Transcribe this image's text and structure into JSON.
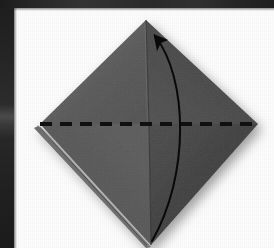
{
  "figure": {
    "kind": "origami-fold-diagram",
    "description": "Gray square sheet rotated 45 degrees (diamond) with a horizontal dashed valley-fold line across the middle and a curved arrow showing the bottom point folding up to the top point.",
    "paper": {
      "shape": "diamond",
      "apex_top": {
        "x": 146,
        "y": 20
      },
      "tip_left": {
        "x": 40,
        "y": 124
      },
      "tip_right": {
        "x": 258,
        "y": 124
      },
      "tip_bottom": {
        "x": 151,
        "y": 245
      },
      "facets": [
        {
          "name": "upper-left-facet",
          "color": "#5c5c5c"
        },
        {
          "name": "upper-right-facet",
          "color": "#4a4a4a"
        },
        {
          "name": "lower-left-facet",
          "color": "#565656"
        },
        {
          "name": "lower-right-facet",
          "color": "#3f3f3f"
        }
      ],
      "center_crease": {
        "from": {
          "x": 146,
          "y": 20
        },
        "to": {
          "x": 151,
          "y": 245
        }
      },
      "layer_edge_visible": true
    },
    "fold_line": {
      "name": "valley-fold-dashed-line",
      "style": "dashed",
      "color": "#111111",
      "thickness_px": 4,
      "dash_px": 12,
      "gap_px": 8,
      "y": 124,
      "x_start": 40,
      "x_end": 258
    },
    "fold_arrow": {
      "name": "fold-direction-arrow",
      "color": "#0a0a0a",
      "thickness_px": 2,
      "start": {
        "x": 152,
        "y": 241
      },
      "control_1": {
        "x": 190,
        "y": 175
      },
      "control_2": {
        "x": 188,
        "y": 78
      },
      "end": {
        "x": 155,
        "y": 36
      },
      "head_tip": {
        "x": 148,
        "y": 28
      },
      "direction": "bottom-point-up-to-top-point"
    },
    "background_color": "#fdfdfd",
    "scan_edge_color": "#232323",
    "shadow_color": "#9a9a9a"
  }
}
